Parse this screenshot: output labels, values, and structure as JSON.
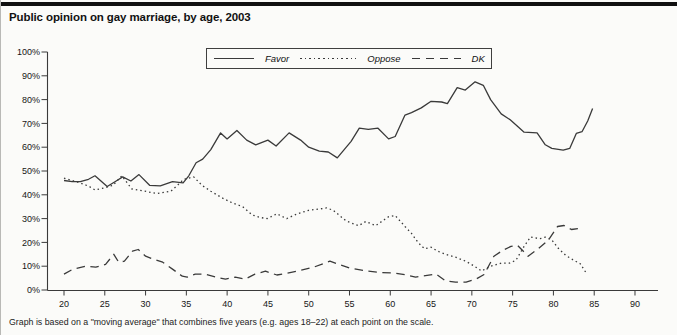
{
  "title": "Public opinion on gay marriage, by age, 2003",
  "note": "Graph is based on a \"moving average\" that combines five years (e.g. ages 18–22) at each point on the scale.",
  "chart_data": {
    "type": "line",
    "title": "Public opinion on gay marriage, by age, 2003",
    "xlabel": "age",
    "ylabel": "percent",
    "xlim": [
      18,
      93
    ],
    "ylim": [
      0,
      100
    ],
    "grid": false,
    "legend_position": "top-center-boxed",
    "x_ticks": [
      20,
      25,
      30,
      35,
      40,
      45,
      50,
      55,
      60,
      65,
      70,
      75,
      80,
      85,
      90
    ],
    "y_ticks": [
      0,
      10,
      20,
      30,
      40,
      50,
      60,
      70,
      80,
      90,
      100
    ],
    "y_tick_suffix": "%",
    "line_color": "#3a3a3a",
    "series": [
      {
        "name": "Favor",
        "style": "solid",
        "points": [
          [
            20,
            46
          ],
          [
            21,
            45.5
          ],
          [
            22,
            45.5
          ],
          [
            23,
            46.5
          ],
          [
            23.8,
            48
          ],
          [
            25.3,
            43.5
          ],
          [
            26.5,
            46
          ],
          [
            27.2,
            47.5
          ],
          [
            28.2,
            45.8
          ],
          [
            29.2,
            48.5
          ],
          [
            30.5,
            44
          ],
          [
            31.8,
            43.8
          ],
          [
            33.3,
            45.5
          ],
          [
            34.6,
            45
          ],
          [
            35.3,
            48
          ],
          [
            36.2,
            53.5
          ],
          [
            37,
            55
          ],
          [
            38,
            59
          ],
          [
            39.2,
            66
          ],
          [
            40,
            63.5
          ],
          [
            41.2,
            67
          ],
          [
            42.4,
            63
          ],
          [
            43.5,
            61
          ],
          [
            45,
            63
          ],
          [
            46,
            60.5
          ],
          [
            47.6,
            66
          ],
          [
            49,
            63
          ],
          [
            50,
            60
          ],
          [
            51.3,
            58.3
          ],
          [
            52.4,
            58
          ],
          [
            53.5,
            55.5
          ],
          [
            55.2,
            62.5
          ],
          [
            56.2,
            68
          ],
          [
            57.3,
            67.5
          ],
          [
            58.5,
            68
          ],
          [
            59.8,
            63.5
          ],
          [
            60.6,
            64.5
          ],
          [
            61.8,
            73.5
          ],
          [
            62.6,
            74.5
          ],
          [
            63.8,
            76.5
          ],
          [
            65,
            79.3
          ],
          [
            66.3,
            79
          ],
          [
            67,
            78.3
          ],
          [
            68.2,
            85
          ],
          [
            69.2,
            84
          ],
          [
            70.4,
            87.5
          ],
          [
            71.4,
            86
          ],
          [
            72.3,
            80
          ],
          [
            73.6,
            74
          ],
          [
            74.7,
            71.5
          ],
          [
            75.7,
            68.5
          ],
          [
            76.4,
            66.3
          ],
          [
            78,
            66
          ],
          [
            79,
            61
          ],
          [
            79.8,
            59.5
          ],
          [
            81.2,
            58.8
          ],
          [
            82,
            59.5
          ],
          [
            82.8,
            65.8
          ],
          [
            83.5,
            66.5
          ],
          [
            84.2,
            71
          ],
          [
            84.8,
            76.3
          ]
        ]
      },
      {
        "name": "Oppose",
        "style": "dotted",
        "points": [
          [
            20,
            47
          ],
          [
            21,
            46
          ],
          [
            22,
            45
          ],
          [
            23.1,
            43.5
          ],
          [
            23.8,
            42
          ],
          [
            25,
            43
          ],
          [
            26,
            44
          ],
          [
            27.1,
            48
          ],
          [
            28.3,
            42.5
          ],
          [
            29.9,
            41.5
          ],
          [
            31.4,
            40.5
          ],
          [
            33.1,
            41.5
          ],
          [
            34.7,
            46.5
          ],
          [
            35.9,
            47.5
          ],
          [
            36.9,
            44
          ],
          [
            38,
            41.5
          ],
          [
            39.5,
            38.5
          ],
          [
            40.7,
            36.5
          ],
          [
            41.9,
            35
          ],
          [
            43.1,
            31.5
          ],
          [
            44,
            30.5
          ],
          [
            44.9,
            30
          ],
          [
            46.1,
            32
          ],
          [
            47.3,
            30
          ],
          [
            48.6,
            32
          ],
          [
            50,
            33.5
          ],
          [
            51.2,
            34
          ],
          [
            52.2,
            34.5
          ],
          [
            53,
            33.5
          ],
          [
            54.6,
            29
          ],
          [
            56.1,
            27
          ],
          [
            57,
            28.8
          ],
          [
            58.2,
            27
          ],
          [
            59.8,
            30.8
          ],
          [
            60.6,
            31.3
          ],
          [
            61.8,
            26.7
          ],
          [
            62.6,
            23.8
          ],
          [
            63.4,
            20
          ],
          [
            64.2,
            17.3
          ],
          [
            65,
            18
          ],
          [
            65.8,
            16.3
          ],
          [
            66.8,
            15
          ],
          [
            68,
            13.8
          ],
          [
            69.3,
            12
          ],
          [
            70.3,
            10
          ],
          [
            71.2,
            8
          ],
          [
            72.3,
            10
          ],
          [
            73.6,
            11.3
          ],
          [
            74.6,
            11.3
          ],
          [
            75.4,
            12.5
          ],
          [
            76.4,
            18.3
          ],
          [
            77.2,
            22.3
          ],
          [
            78.3,
            21.5
          ],
          [
            79,
            22.2
          ],
          [
            79.8,
            21
          ],
          [
            80.6,
            17.5
          ],
          [
            81.5,
            14.6
          ],
          [
            82.5,
            12.5
          ],
          [
            83.3,
            11
          ],
          [
            84.1,
            6.7
          ]
        ]
      },
      {
        "name": "DK",
        "style": "dashed",
        "points": [
          [
            20,
            6.7
          ],
          [
            21.1,
            8.8
          ],
          [
            22.7,
            10
          ],
          [
            23.9,
            9.6
          ],
          [
            25.1,
            10.8
          ],
          [
            26.1,
            15
          ],
          [
            26.7,
            11.7
          ],
          [
            27.4,
            12.1
          ],
          [
            28.4,
            16.3
          ],
          [
            29.1,
            17
          ],
          [
            30,
            14.2
          ],
          [
            31,
            12.9
          ],
          [
            32.1,
            11.7
          ],
          [
            33.3,
            8.8
          ],
          [
            34.5,
            5.8
          ],
          [
            35.1,
            5.4
          ],
          [
            36.1,
            6.7
          ],
          [
            37.3,
            6.7
          ],
          [
            38.6,
            5.4
          ],
          [
            39.8,
            4.6
          ],
          [
            41,
            5.4
          ],
          [
            42.2,
            4.6
          ],
          [
            43.4,
            6.7
          ],
          [
            44.7,
            7.9
          ],
          [
            46.1,
            6.3
          ],
          [
            48.6,
            7.9
          ],
          [
            50.6,
            9.6
          ],
          [
            52.6,
            12.1
          ],
          [
            55,
            9.2
          ],
          [
            57.3,
            7.9
          ],
          [
            59,
            7.3
          ],
          [
            60.6,
            7.1
          ],
          [
            62,
            6.3
          ],
          [
            63.1,
            5.4
          ],
          [
            64.3,
            6
          ],
          [
            65.6,
            6.7
          ],
          [
            66.8,
            3.8
          ],
          [
            68,
            3.3
          ],
          [
            69.3,
            3.3
          ],
          [
            70.5,
            4.6
          ],
          [
            71.5,
            6.5
          ],
          [
            72.7,
            14.2
          ],
          [
            73.8,
            16.7
          ],
          [
            74.8,
            18.3
          ],
          [
            75.6,
            18.8
          ],
          [
            76.9,
            14.2
          ],
          [
            78.2,
            17.5
          ],
          [
            79.4,
            21
          ],
          [
            80.5,
            26.7
          ],
          [
            81.3,
            27.1
          ],
          [
            82.2,
            25.4
          ],
          [
            83,
            25.8
          ]
        ]
      }
    ]
  }
}
